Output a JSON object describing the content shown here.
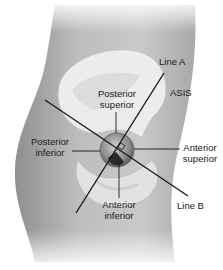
{
  "figure": {
    "labels": {
      "line_a": "Line A",
      "asis": "ASIS",
      "posterior_superior_1": "Posterior",
      "posterior_superior_2": "superior",
      "posterior_inferior_1": "Posterior",
      "posterior_inferior_2": "inferior",
      "anterior_superior_1": "Anterior",
      "anterior_superior_2": "superior",
      "anterior_inferior_1": "Anterior",
      "anterior_inferior_2": "inferior",
      "line_b": "Line B"
    },
    "colors": {
      "skin_dark": "#9a9a9a",
      "skin_light": "#d8d8d8",
      "bone": "#ececec",
      "line": "#1a1a1a"
    }
  }
}
